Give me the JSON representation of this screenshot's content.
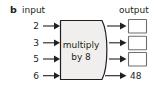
{
  "figure": {
    "panel_letter": "b",
    "input_header": "input",
    "output_header": "output",
    "process_line1": "multiply",
    "process_line2": "by 8",
    "colors": {
      "background": "#ffffff",
      "stroke": "#231f20",
      "process_fill": "#f1efed",
      "box_stroke": "#6f6f6f",
      "box_fill": "#ffffff"
    }
  },
  "rows": [
    {
      "input": "2",
      "output": "",
      "output_is_box": true
    },
    {
      "input": "3",
      "output": "",
      "output_is_box": true
    },
    {
      "input": "5",
      "output": "",
      "output_is_box": true
    },
    {
      "input": "6",
      "output": "48",
      "output_is_box": false
    }
  ]
}
